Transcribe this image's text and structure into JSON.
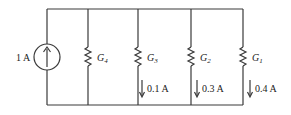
{
  "diagram": {
    "type": "parallel-circuit",
    "source": {
      "label": "1 A",
      "kind": "current-source",
      "direction": "up"
    },
    "branches": [
      {
        "name": "G4",
        "symbol": "G",
        "sub": "4",
        "current": null
      },
      {
        "name": "G3",
        "symbol": "G",
        "sub": "3",
        "current": "0.1 A"
      },
      {
        "name": "G2",
        "symbol": "G",
        "sub": "2",
        "current": "0.3 A"
      },
      {
        "name": "G1",
        "symbol": "G",
        "sub": "1",
        "current": "0.4 A"
      }
    ],
    "colors": {
      "wire": "#3a3a3a",
      "text": "#222222",
      "background": "#ffffff"
    }
  }
}
